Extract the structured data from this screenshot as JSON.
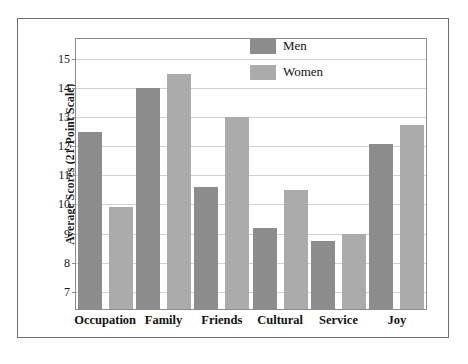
{
  "figure": {
    "frame_color": "#6f6f6f",
    "background": "#ffffff"
  },
  "legend": {
    "position": "top-right",
    "entries": [
      {
        "label": "Men",
        "color": "#8d8d8d",
        "swatch_name": "men-swatch"
      },
      {
        "label": "Women",
        "color": "#ababab",
        "swatch_name": "women-swatch"
      }
    ]
  },
  "chart_data": {
    "type": "bar",
    "title": "",
    "subtitle": "",
    "xlabel": "",
    "ylabel": "Average Scores (21-Point Scale)",
    "categories": [
      "Occupation",
      "Family",
      "Friends",
      "Cultural",
      "Service",
      "Joy"
    ],
    "series": [
      {
        "name": "Men",
        "color": "#8d8d8d",
        "values": [
          12.5,
          14.0,
          10.6,
          9.2,
          8.75,
          12.1
        ]
      },
      {
        "name": "Women",
        "color": "#ababab",
        "values": [
          9.9,
          14.5,
          13.0,
          10.5,
          9.0,
          12.75
        ]
      }
    ],
    "ylim": [
      6.4,
      15.7
    ],
    "yticks": [
      7,
      8,
      9,
      10,
      11,
      12,
      13,
      14,
      15
    ],
    "ytick_labels": [
      "7",
      "8",
      "9",
      "10",
      "11",
      "12",
      "13",
      "14",
      "15"
    ],
    "grid": true,
    "grid_axis": "y",
    "grid_color": "#d2d2d2",
    "legend_position": "top-right",
    "bar_group_gap": true
  },
  "caption": {
    "text": ""
  }
}
